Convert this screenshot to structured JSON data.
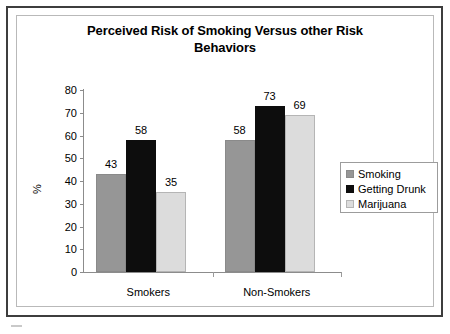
{
  "chart_data": {
    "type": "bar",
    "title": "Perceived Risk of Smoking Versus other Risk Behaviors",
    "title_line1": "Perceived Risk of Smoking Versus other Risk",
    "title_line2": "Behaviors",
    "xlabel": "",
    "ylabel": "%",
    "categories": [
      "Smokers",
      "Non-Smokers"
    ],
    "series": [
      {
        "name": "Smoking",
        "values": [
          43,
          58
        ],
        "color": "#969696"
      },
      {
        "name": "Getting Drunk",
        "values": [
          58,
          73
        ],
        "color": "#0d0d0d"
      },
      {
        "name": "Marijuana",
        "values": [
          35,
          69
        ],
        "color": "#dcdcdc"
      }
    ],
    "series_by_group": [
      {
        "category": "Smokers",
        "Smoking": 43,
        "Getting Drunk": 58,
        "Marijuana": 35
      },
      {
        "category": "Non-Smokers",
        "Smoking": 69,
        "Getting Drunk": 73,
        "Marijuana": 69
      }
    ],
    "ylim": [
      0,
      80
    ],
    "ytick_labels": [
      "0",
      "10",
      "20",
      "30",
      "40",
      "50",
      "60",
      "70",
      "80"
    ],
    "ytick_values": [
      0,
      10,
      20,
      30,
      40,
      50,
      60,
      70,
      80
    ],
    "grid": false,
    "legend_position": "right",
    "data_labels": [
      "43",
      "58",
      "35",
      "69",
      "73",
      "69"
    ]
  },
  "legend": {
    "items": [
      {
        "label": "Smoking",
        "swatch": "smoking"
      },
      {
        "label": "Getting Drunk",
        "swatch": "drunk"
      },
      {
        "label": "Marijuana",
        "swatch": "marijuana"
      }
    ]
  }
}
